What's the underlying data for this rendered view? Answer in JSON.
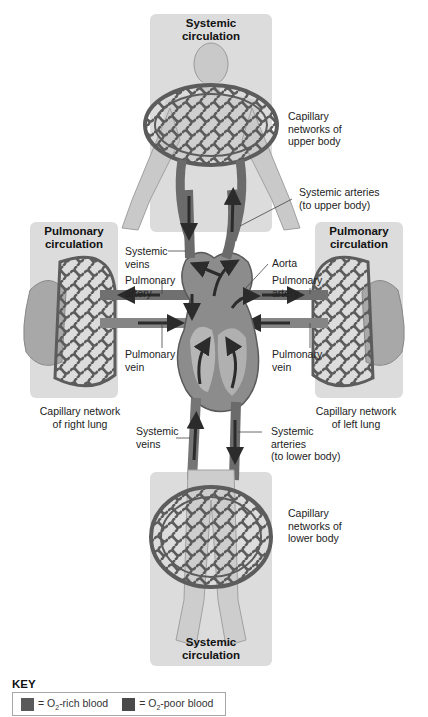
{
  "panels": {
    "systemic_top": {
      "title_line1": "Systemic",
      "title_line2": "circulation"
    },
    "pulmonary_left": {
      "title_line1": "Pulmonary",
      "title_line2": "circulation"
    },
    "pulmonary_right": {
      "title_line1": "Pulmonary",
      "title_line2": "circulation"
    },
    "systemic_bottom": {
      "title_line1": "Systemic",
      "title_line2": "circulation"
    }
  },
  "labels": {
    "cap_upper": [
      "Capillary",
      "networks of",
      "upper body"
    ],
    "sys_arteries_upper": [
      "Systemic arteries",
      "(to upper body)"
    ],
    "sys_veins_upper": [
      "Systemic",
      "veins"
    ],
    "aorta": "Aorta",
    "pulm_artery_left": [
      "Pulmonary",
      "artery"
    ],
    "pulm_artery_right": [
      "Pulmonary",
      "artery"
    ],
    "pulm_vein_left": [
      "Pulmonary",
      "vein"
    ],
    "pulm_vein_right": [
      "Pulmonary",
      "vein"
    ],
    "cap_right_lung": [
      "Capillary network",
      "of right lung"
    ],
    "cap_left_lung": [
      "Capillary network",
      "of left lung"
    ],
    "sys_veins_lower": [
      "Systemic",
      "veins"
    ],
    "sys_arteries_lower": [
      "Systemic",
      "arteries",
      "(to lower body)"
    ],
    "cap_lower": [
      "Capillary",
      "networks of",
      "lower body"
    ]
  },
  "key": {
    "title": "KEY",
    "items": [
      {
        "prefix": "= O",
        "sub": "2",
        "suffix": "-rich blood",
        "color": "#5a5a5a"
      },
      {
        "prefix": "= O",
        "sub": "2",
        "suffix": "-poor blood",
        "color": "#4a4a4a"
      }
    ]
  },
  "colors": {
    "panel_bg": "#dcdcdc",
    "vessel": "#6e6e6e",
    "vessel_dark": "#4d4d4d",
    "body": "#c8c8c8",
    "lung": "#a5a5a5",
    "heart": "#8a8a8a",
    "arrow": "#2b2b2b"
  }
}
